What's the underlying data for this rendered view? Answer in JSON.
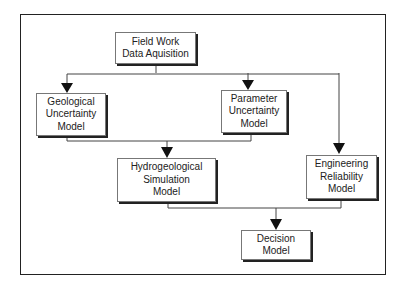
{
  "nodes": {
    "field_work": {
      "lines": [
        "Field Work",
        "Data Aquisition"
      ]
    },
    "geological": {
      "lines": [
        "Geological",
        "Uncertainty",
        "Model"
      ]
    },
    "parameter": {
      "lines": [
        "Parameter",
        "Uncertainty",
        "Model"
      ]
    },
    "hydrogeological": {
      "lines": [
        "Hydrogeological",
        "Simulation",
        "Model"
      ]
    },
    "engineering": {
      "lines": [
        "Engineering",
        "Reliability",
        "Model"
      ]
    },
    "decision": {
      "lines": [
        "Decision",
        "Model"
      ]
    }
  },
  "edges": [
    {
      "from": "field_work",
      "to": "geological"
    },
    {
      "from": "field_work",
      "to": "parameter"
    },
    {
      "from": "field_work",
      "to": "engineering"
    },
    {
      "from": "geological",
      "to": "hydrogeological"
    },
    {
      "from": "parameter",
      "to": "hydrogeological"
    },
    {
      "from": "hydrogeological",
      "to": "decision"
    },
    {
      "from": "engineering",
      "to": "decision"
    }
  ]
}
